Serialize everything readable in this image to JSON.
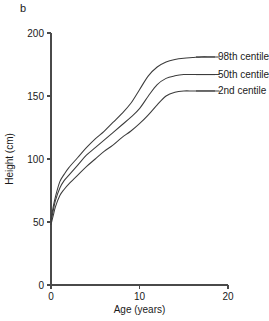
{
  "figure": {
    "panel_label": "b"
  },
  "chart_data": {
    "type": "line",
    "title": "",
    "xlabel": "Age (years)",
    "ylabel": "Height (cm)",
    "xlim": [
      0,
      20
    ],
    "ylim": [
      0,
      200
    ],
    "xticks": [
      0,
      10,
      20
    ],
    "xtick_labels": [
      "0",
      "10",
      "20"
    ],
    "yticks": [
      0,
      50,
      100,
      150,
      200
    ],
    "ytick_labels": [
      "0",
      "50",
      "100",
      "150",
      "200"
    ],
    "grid": false,
    "legend_position": "right-inline-labels",
    "x": [
      0,
      0.25,
      0.5,
      1,
      1.5,
      2,
      3,
      4,
      5,
      6,
      7,
      8,
      9,
      10,
      11,
      12,
      13,
      14,
      15,
      16,
      17,
      18,
      19
    ],
    "series": [
      {
        "name": "98th centile",
        "label": "98th centile",
        "color": "#3c3c3c",
        "values": [
          52,
          62,
          70,
          82,
          88,
          93,
          101,
          109,
          116,
          122,
          129,
          136,
          144,
          155,
          166,
          173,
          177,
          179,
          180,
          180.5,
          181,
          181,
          181
        ],
        "plateau_value": 181,
        "label_y_value": 181
      },
      {
        "name": "50th centile",
        "label": "50th centile",
        "color": "#3c3c3c",
        "values": [
          50,
          59,
          67,
          77,
          83,
          87,
          95,
          103,
          109,
          115,
          121,
          127,
          133,
          140,
          150,
          159,
          164,
          166,
          167,
          167,
          167,
          167,
          167
        ],
        "plateau_value": 167,
        "label_y_value": 167
      },
      {
        "name": "2nd centile",
        "label": "2nd centile",
        "color": "#3c3c3c",
        "values": [
          48,
          55,
          62,
          71,
          76,
          80,
          87,
          94,
          100,
          106,
          111,
          117,
          122,
          128,
          135,
          143,
          150,
          153,
          154,
          154,
          154,
          154,
          154
        ],
        "plateau_value": 154,
        "label_y_value": 154
      }
    ],
    "legend_entries": [
      "98th centile",
      "50th centile",
      "2nd centile"
    ]
  },
  "colors": {
    "axis": "#4a4a4a",
    "curve": "#3c3c3c",
    "text": "#1a1a1a",
    "background": "#ffffff"
  }
}
